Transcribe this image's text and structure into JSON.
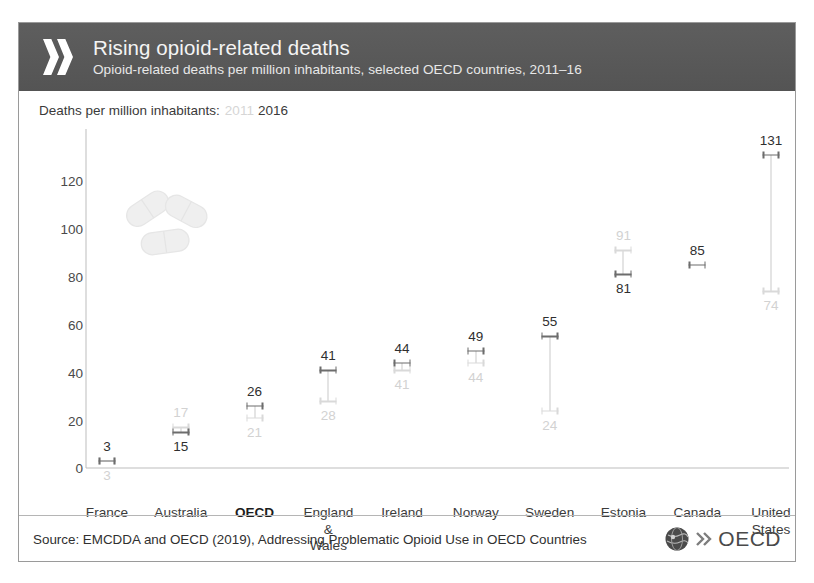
{
  "header": {
    "title": "Rising opioid-related deaths",
    "subtitle": "Opioid-related deaths per million inhabitants, selected OECD countries, 2011–16",
    "chevron_icon": "double-chevron-right-icon",
    "band_color": "#585858"
  },
  "legend": {
    "label": "Deaths per million inhabitants:",
    "series_2011": "2011",
    "series_2016": "2016",
    "color_2011": "#d6d6d6",
    "color_2016": "#3a3a3a"
  },
  "footer": {
    "source": "Source: EMCDDA and OECD (2019), Addressing Problematic Opioid Use in OECD Countries",
    "logo_text": "OECD",
    "logo_globe_icon": "globe-icon",
    "logo_chevrons_icon": "double-chevron-right-icon"
  },
  "decoration": {
    "pills_icon": "pills-capsules-icon"
  },
  "chart_data": {
    "type": "scatter",
    "subtype": "dumbbell",
    "title": "Rising opioid-related deaths",
    "subtitle": "Opioid-related deaths per million inhabitants, selected OECD countries, 2011–16",
    "xlabel": "",
    "ylabel": "Deaths per million inhabitants",
    "ylim": [
      0,
      131
    ],
    "yticks": [
      0,
      20,
      40,
      60,
      80,
      100,
      120
    ],
    "ytick_labels": [
      "0",
      "20",
      "40",
      "60",
      "80",
      "100",
      "120"
    ],
    "grid": false,
    "legend_position": "top-left",
    "categories": [
      "France",
      "Australia",
      "OECD",
      "England & Wales",
      "Ireland",
      "Norway",
      "Sweden",
      "Estonia",
      "Canada",
      "United States"
    ],
    "category_lines": [
      [
        "France"
      ],
      [
        "Australia"
      ],
      [
        "OECD"
      ],
      [
        "England",
        "&",
        "Wales"
      ],
      [
        "Ireland"
      ],
      [
        "Norway"
      ],
      [
        "Sweden"
      ],
      [
        "Estonia"
      ],
      [
        "Canada"
      ],
      [
        "United",
        "States"
      ]
    ],
    "highlighted_category": "OECD",
    "series": [
      {
        "name": "2011",
        "color": "#d9d9d9",
        "values": [
          3,
          17,
          21,
          28,
          41,
          44,
          24,
          91,
          null,
          74
        ]
      },
      {
        "name": "2016",
        "color": "#6d6d6d",
        "values": [
          3,
          15,
          26,
          41,
          44,
          49,
          55,
          81,
          85,
          131
        ]
      }
    ],
    "points": [
      {
        "category": "France",
        "v2011": 3,
        "v2016": 3,
        "label_2016_pos": "above",
        "label_2011_pos": "below"
      },
      {
        "category": "Australia",
        "v2011": 17,
        "v2016": 15,
        "label_2016_pos": "below",
        "label_2011_pos": "above"
      },
      {
        "category": "OECD",
        "v2011": 21,
        "v2016": 26,
        "label_2016_pos": "above",
        "label_2011_pos": "below"
      },
      {
        "category": "England & Wales",
        "v2011": 28,
        "v2016": 41,
        "label_2016_pos": "above",
        "label_2011_pos": "below"
      },
      {
        "category": "Ireland",
        "v2011": 41,
        "v2016": 44,
        "label_2016_pos": "above",
        "label_2011_pos": "below"
      },
      {
        "category": "Norway",
        "v2011": 44,
        "v2016": 49,
        "label_2016_pos": "above",
        "label_2011_pos": "below"
      },
      {
        "category": "Sweden",
        "v2011": 24,
        "v2016": 55,
        "label_2016_pos": "above",
        "label_2011_pos": "below"
      },
      {
        "category": "Estonia",
        "v2011": 91,
        "v2016": 81,
        "label_2016_pos": "below",
        "label_2011_pos": "above"
      },
      {
        "category": "Canada",
        "v2011": null,
        "v2016": 85,
        "label_2016_pos": "above",
        "label_2011_pos": "none"
      },
      {
        "category": "United States",
        "v2011": 74,
        "v2016": 131,
        "label_2016_pos": "above",
        "label_2011_pos": "below"
      }
    ]
  }
}
